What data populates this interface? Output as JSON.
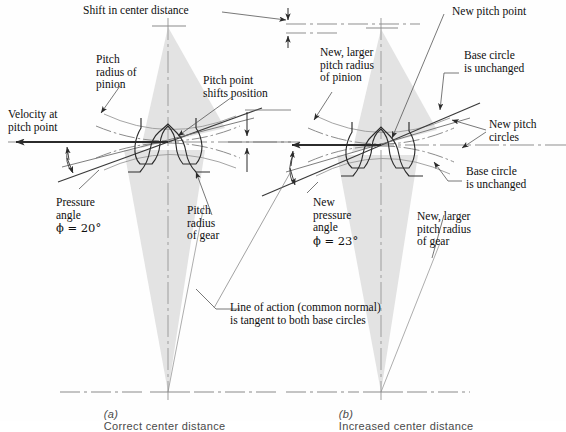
{
  "figure": {
    "type": "engineering-diagram",
    "panels": [
      {
        "id": "a",
        "letter": "(a)",
        "caption": "Correct center distance"
      },
      {
        "id": "b",
        "letter": "(b)",
        "caption": "Increased center distance"
      }
    ]
  },
  "labels": {
    "shift_center_distance": "Shift in center distance",
    "pitch_radius_pinion": "Pitch\nradius of\npinion",
    "pitch_point_shifts": "Pitch point\nshifts position",
    "velocity_at_pitch_point": "Velocity at\npitch point",
    "pressure_angle": "Pressure\nangle",
    "pressure_angle_value": "ϕ = 20°",
    "pitch_radius_gear": "Pitch\nradius\nof gear",
    "line_of_action": "Line of action (common normal)\nis tangent to both base circles",
    "new_pitch_point": "New pitch point",
    "new_larger_pitch_radius_pinion": "New, larger\npitch radius\nof pinion",
    "base_circle_unchanged_top": "Base circle\nis unchanged",
    "new_pitch_circles": "New pitch\ncircles",
    "base_circle_unchanged_bottom": "Base circle\nis unchanged",
    "new_pressure_angle": "New\npressure\nangle",
    "new_pressure_angle_value": "ϕ = 23°",
    "new_larger_pitch_radius_gear": "New, larger\npitch radius\nof gear"
  },
  "values": {
    "pressure_angle_a_deg": 20,
    "pressure_angle_b_deg": 23,
    "phi_symbol": "ϕ",
    "degree_symbol": "°"
  },
  "colors": {
    "background": "#fefefe",
    "ink": "#1a1a1a",
    "line": "#3a3a3a",
    "sector_fill": "#e2e2e2",
    "centerline": "#9a9a9a",
    "leader": "#555555",
    "caption": "#4a4a4a",
    "pitch_circle": "#777777"
  },
  "geometry": {
    "panel_a": {
      "pitch_point": [
        168,
        142
      ],
      "pinion_center": [
        168,
        26
      ],
      "gear_center": [
        168,
        392
      ],
      "pressure_line_angle_deg": 20
    },
    "panel_b": {
      "pitch_point": [
        381,
        145
      ],
      "pinion_center": [
        381,
        28
      ],
      "gear_center": [
        381,
        392
      ],
      "pressure_line_angle_deg": 23
    },
    "center_distance_shift_px": 9
  }
}
